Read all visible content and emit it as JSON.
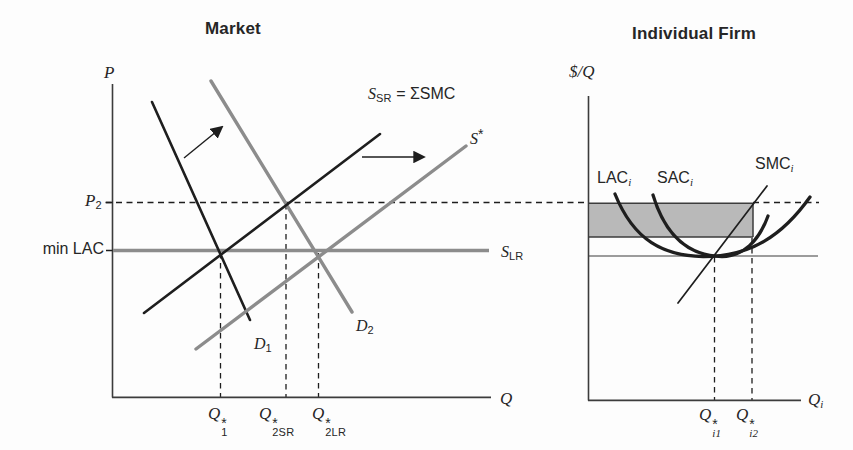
{
  "market": {
    "title": "Market",
    "y_axis_label": "P",
    "x_axis_label": "Q",
    "price_labels": {
      "p2": {
        "base": "P",
        "sub": "2"
      },
      "min_lac": "min LAC"
    },
    "curve_labels": {
      "ssr": {
        "base": "S",
        "sub": "SR",
        "rest": " = ΣSMC"
      },
      "s_star": {
        "base": "S",
        "sup": "*"
      },
      "slr": {
        "base": "S",
        "sub": "LR"
      },
      "d1": {
        "base": "D",
        "sub": "1"
      },
      "d2": {
        "base": "D",
        "sub": "2"
      }
    },
    "quantity_labels": {
      "q1": {
        "base": "Q",
        "sup": "*",
        "sub": "1"
      },
      "q2sr": {
        "base": "Q",
        "sup": "*",
        "sub": "2SR"
      },
      "q2lr": {
        "base": "Q",
        "sup": "*",
        "sub": "2LR"
      }
    }
  },
  "firm": {
    "title": "Individual Firm",
    "y_axis_label": "$/Q",
    "x_axis_label": {
      "base": "Q",
      "sub": "i"
    },
    "curve_labels": {
      "lac": {
        "base": "LAC",
        "sub": "i"
      },
      "sac": {
        "base": "SAC",
        "sub": "i"
      },
      "smc": {
        "base": "SMC",
        "sub": "i"
      }
    },
    "quantity_labels": {
      "qi1": {
        "base": "Q",
        "sup": "*",
        "sub": "i1"
      },
      "qi2": {
        "base": "Q",
        "sup": "*",
        "sub": "i2"
      }
    }
  },
  "colors": {
    "line_black": "#1e1e1e",
    "line_gray": "#8c8c8c",
    "profit_shade": "#b9b9b9",
    "axis": "#3c3c3c"
  }
}
